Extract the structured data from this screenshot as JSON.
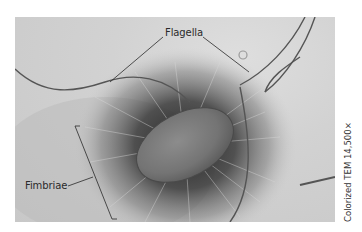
{
  "figure": {
    "labels": {
      "flagella": "Flagella",
      "fimbriae": "Fimbriae"
    },
    "caption": "Colorized TEM 14,500×",
    "colors": {
      "background": "#c9c9c9",
      "cell_body": "#7a7a7a",
      "halo": "#3a3a3a",
      "leader_lines": "#2a2a2a"
    }
  }
}
